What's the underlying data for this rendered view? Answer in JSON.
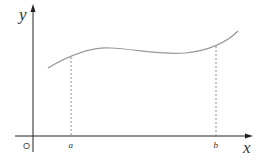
{
  "diagram": {
    "type": "function-graph",
    "axes": {
      "x_label": "x",
      "y_label": "y",
      "origin_label": "O"
    },
    "interval": {
      "a_label": "a",
      "b_label": "b"
    },
    "colors": {
      "axis": "#222222",
      "curve": "#999999",
      "dashed": "#777777",
      "background": "#ffffff"
    }
  }
}
